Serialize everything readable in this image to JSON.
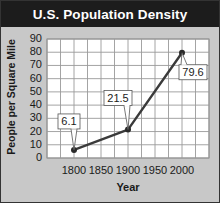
{
  "title": "U.S. Population Density",
  "chart_data": {
    "type": "line",
    "title": "U.S. Population Density",
    "xlabel": "Year",
    "ylabel": "People per Square Mile",
    "x": [
      1800,
      1900,
      2000
    ],
    "series": [
      {
        "name": "People per Square Mile",
        "values": [
          6.1,
          21.5,
          79.6
        ]
      }
    ],
    "data_labels": [
      "6.1",
      "21.5",
      "79.6"
    ],
    "xticks": [
      "1800",
      "1850",
      "1900",
      "1950",
      "2000"
    ],
    "yticks": [
      "0",
      "10",
      "20",
      "30",
      "40",
      "50",
      "60",
      "70",
      "80",
      "90"
    ],
    "xlim": [
      1750,
      2050
    ],
    "ylim": [
      0,
      90
    ],
    "grid": true,
    "legend": null
  }
}
